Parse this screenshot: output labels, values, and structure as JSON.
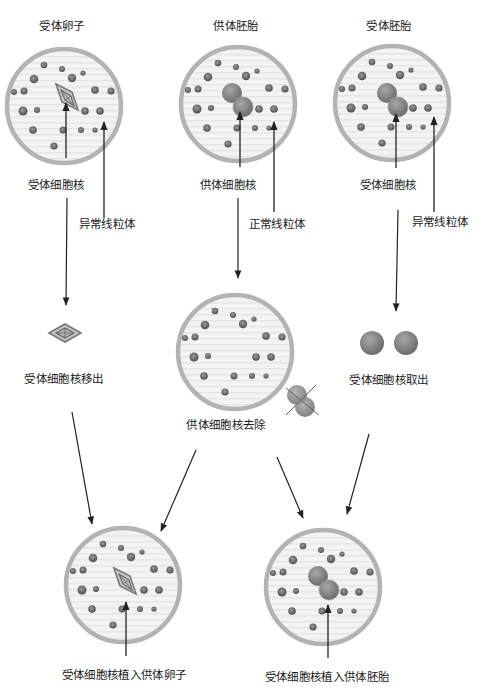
{
  "colors": {
    "cell_border": "#b0b0b0",
    "cell_fill": "#f2f2f2",
    "mito": "#6a6a6a",
    "nucleus": "#8a8a8a",
    "arrow": "#222222",
    "text": "#1a1a1a"
  },
  "titles": {
    "recipient_egg": "受体卵子",
    "donor_embryo": "供体胚胎",
    "recipient_embryo": "受体胚胎"
  },
  "labels": {
    "recipient_nucleus_1": "受体细胞核",
    "abnormal_mito_1": "异常线粒体",
    "donor_nucleus": "供体细胞核",
    "normal_mito": "正常线粒体",
    "recipient_nucleus_2": "受体细胞核",
    "abnormal_mito_2": "异常线粒体"
  },
  "steps": {
    "nucleus_removed": "受体细胞核移出",
    "donor_nucleus_removed": "供体细胞核去除",
    "nucleus_extracted": "受体细胞核取出",
    "implant_into_egg": "受体细胞核植入供体卵子",
    "implant_into_embryo": "受体细胞核植入供体胚胎"
  },
  "icons": {
    "spindle": "spindle-nucleus-icon",
    "pronuclei": "pronuclei-icon",
    "crossed_out": "crossed-out-icon"
  }
}
